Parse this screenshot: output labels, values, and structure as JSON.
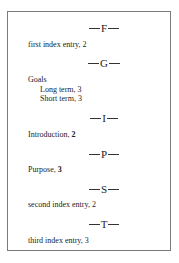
{
  "index": {
    "sections": [
      {
        "letter": "F",
        "entries": [
          {
            "text": "first index entry, ",
            "page": "2",
            "bold_page": false,
            "level": 1
          }
        ]
      },
      {
        "letter": "G",
        "entries": [
          {
            "text": "Goals",
            "page": "",
            "bold_page": false,
            "level": 1
          },
          {
            "text": "Long term, ",
            "page": "3",
            "bold_page": false,
            "level": 2
          },
          {
            "text": "Short term, ",
            "page": "3",
            "bold_page": false,
            "level": 2
          }
        ]
      },
      {
        "letter": "I",
        "entries": [
          {
            "text": "Introduction, ",
            "page": "2",
            "bold_page": true,
            "level": 1
          }
        ]
      },
      {
        "letter": "P",
        "entries": [
          {
            "text": "Purpose, ",
            "page": "3",
            "bold_page": true,
            "level": 1
          }
        ]
      },
      {
        "letter": "S",
        "entries": [
          {
            "text": "second index entry, ",
            "page": "2",
            "bold_page": false,
            "level": 1
          }
        ]
      },
      {
        "letter": "T",
        "entries": [
          {
            "text": "third index entry, ",
            "page": "3",
            "bold_page": false,
            "level": 1
          }
        ]
      }
    ]
  },
  "colors": {
    "border": "#7a7a7a",
    "text": "#222222",
    "background": "#ffffff"
  }
}
